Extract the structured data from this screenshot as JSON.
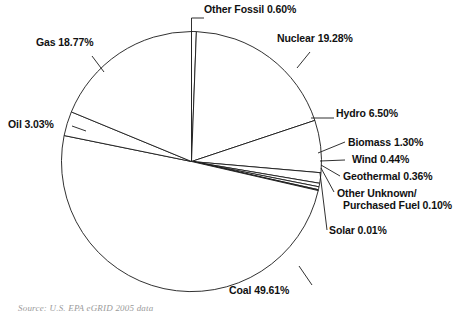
{
  "figure": {
    "source_note": "Source: U.S. EPA eGRID 2005 data"
  },
  "chart_data": {
    "type": "pie",
    "title": "",
    "xlabel": "",
    "ylabel": "",
    "units": "percent",
    "legend_position": "none",
    "grid": false,
    "label_format": "{name} {value}%",
    "start_angle_deg": -90,
    "direction": "clockwise",
    "total": 100.0,
    "categories": [
      "Other Fossil",
      "Nuclear",
      "Hydro",
      "Biomass",
      "Wind",
      "Geothermal",
      "Other Unknown/ Purchased Fuel",
      "Solar",
      "Coal",
      "Oil",
      "Gas"
    ],
    "values": [
      0.6,
      19.28,
      6.5,
      1.3,
      0.44,
      0.36,
      0.1,
      0.01,
      49.61,
      3.03,
      18.77
    ],
    "slices": [
      {
        "name": "Other Fossil",
        "value": 0.6,
        "label": "Other Fossil 0.60%"
      },
      {
        "name": "Nuclear",
        "value": 19.28,
        "label": "Nuclear 19.28%"
      },
      {
        "name": "Hydro",
        "value": 6.5,
        "label": "Hydro 6.50%"
      },
      {
        "name": "Biomass",
        "value": 1.3,
        "label": "Biomass 1.30%"
      },
      {
        "name": "Wind",
        "value": 0.44,
        "label": "Wind 0.44%"
      },
      {
        "name": "Geothermal",
        "value": 0.36,
        "label": "Geothermal 0.36%"
      },
      {
        "name": "Other Unknown/ Purchased Fuel",
        "value": 0.1,
        "label": "Other Unknown/ Purchased Fuel 0.10%"
      },
      {
        "name": "Solar",
        "value": 0.01,
        "label": "Solar 0.01%"
      },
      {
        "name": "Coal",
        "value": 49.61,
        "label": "Coal 49.61%"
      },
      {
        "name": "Oil",
        "value": 3.03,
        "label": "Oil 3.03%"
      },
      {
        "name": "Gas",
        "value": 18.77,
        "label": "Gas 18.77%"
      }
    ],
    "labels": {
      "other_fossil": "Other Fossil 0.60%",
      "nuclear": "Nuclear 19.28%",
      "hydro": "Hydro 6.50%",
      "biomass": "Biomass 1.30%",
      "wind": "Wind 0.44%",
      "geothermal": "Geothermal 0.36%",
      "other_unknown_line1": "Other Unknown/",
      "other_unknown_line2": "Purchased Fuel 0.10%",
      "solar": "Solar 0.01%",
      "coal": "Coal 49.61%",
      "oil": "Oil 3.03%",
      "gas": "Gas 18.77%"
    },
    "style": {
      "fill": "#ffffff",
      "stroke": "#1a1a1a",
      "leader_stroke": "#1a1a1a",
      "background": "#ffffff"
    }
  }
}
